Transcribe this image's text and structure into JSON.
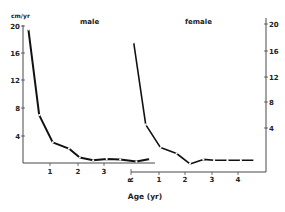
{
  "chart_data": [
    {
      "type": "line",
      "title": "male",
      "xlabel": "Age (yr)",
      "ylabel": "cm/yr",
      "x_ticks": [
        "1",
        "2",
        "3"
      ],
      "y_ticks": [
        "4",
        "8",
        "12",
        "16",
        "20"
      ],
      "xlim": [
        0,
        4.8
      ],
      "ylim": [
        0,
        20
      ],
      "grid": false,
      "series": [
        {
          "name": "male",
          "x": [
            0.2,
            0.6,
            1.1,
            1.7,
            2.1,
            2.6,
            3.1,
            3.6,
            4.2,
            4.7
          ],
          "y": [
            19.5,
            7.0,
            3.0,
            2.1,
            0.8,
            0.4,
            0.6,
            0.5,
            0.2,
            0.6
          ]
        }
      ]
    },
    {
      "type": "line",
      "title": "female",
      "xlabel": "Age (yr)",
      "ylabel": "cm/yr",
      "x_ticks": [
        "R",
        "1",
        "2",
        "3",
        "4"
      ],
      "y_ticks": [
        "4",
        "8",
        "12",
        "16",
        "20"
      ],
      "xlim": [
        0,
        4.8
      ],
      "ylim": [
        0,
        20
      ],
      "grid": false,
      "series": [
        {
          "name": "female",
          "x": [
            0.1,
            0.55,
            1.1,
            1.7,
            2.2,
            2.7,
            3.1,
            3.6,
            4.1,
            4.6
          ],
          "y": [
            17.5,
            6.4,
            3.3,
            2.5,
            1.1,
            1.7,
            1.6,
            1.6,
            1.6,
            1.6
          ]
        }
      ]
    }
  ],
  "labels": {
    "unit": "cm/yr",
    "male_title": "male",
    "female_title": "female",
    "x_axis": "Age (yr)",
    "origin_marker": "R"
  },
  "colors": {
    "line": "#111111",
    "axis": "#333333",
    "text": "#222222"
  }
}
